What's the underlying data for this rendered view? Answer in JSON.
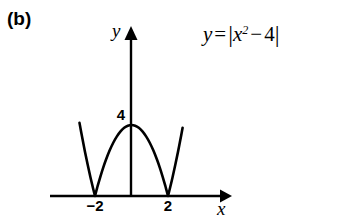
{
  "figure": {
    "panel_label": "(b)",
    "equation": {
      "lhs": "y",
      "relation": "=",
      "open_bar": "|",
      "base": "x",
      "exponent": "2",
      "minus": "−",
      "constant": "4",
      "close_bar": "|",
      "plain": "y = |x² − 4|"
    },
    "axes": {
      "x_label": "x",
      "y_label": "y",
      "stroke_color": "#000000",
      "background_color": "#ffffff"
    },
    "tick_labels": {
      "x_left": "−2",
      "x_right": "2",
      "y_peak": "4"
    }
  },
  "chart_data": {
    "type": "line",
    "title": "",
    "subtitle": "",
    "xlabel": "x",
    "ylabel": "y",
    "function": "y = |x^2 - 4|",
    "xlim": [
      -3.55,
      3.0
    ],
    "ylim": [
      0,
      9.2
    ],
    "grid": false,
    "legend": null,
    "annotations": [
      {
        "text": "y = |x² − 4|",
        "x": 2.0,
        "y": 8.6
      },
      {
        "text": "(b)",
        "x": -3.5,
        "y": 9.0
      }
    ],
    "x_ticks": [
      -2,
      2
    ],
    "x_tick_labels": [
      "−2",
      "2"
    ],
    "y_ticks": [
      4
    ],
    "y_tick_labels": [
      "4"
    ],
    "key_points": [
      {
        "label": "left cusp (root)",
        "x": -2,
        "y": 0
      },
      {
        "label": "right cusp (root)",
        "x": 2,
        "y": 0
      },
      {
        "label": "arch vertex",
        "x": 0,
        "y": 4
      }
    ],
    "series": [
      {
        "name": "y = |x^2 - 4|",
        "color": "#000000",
        "line_width": 2.6,
        "x": [
          -2.85,
          -2.7,
          -2.55,
          -2.4,
          -2.25,
          -2.1,
          -2.0,
          -1.85,
          -1.7,
          -1.55,
          -1.4,
          -1.2,
          -1.0,
          -0.8,
          -0.6,
          -0.4,
          -0.2,
          0.0,
          0.2,
          0.4,
          0.6,
          0.8,
          1.0,
          1.2,
          1.4,
          1.55,
          1.7,
          1.85,
          2.0,
          2.1,
          2.25,
          2.4,
          2.55,
          2.7,
          2.8
        ],
        "y": [
          4.12,
          3.29,
          2.5,
          1.76,
          1.06,
          0.41,
          0.0,
          0.58,
          1.11,
          1.6,
          2.04,
          2.56,
          3.0,
          3.36,
          3.64,
          3.84,
          3.96,
          4.0,
          3.96,
          3.84,
          3.64,
          3.36,
          3.0,
          2.56,
          2.04,
          1.6,
          1.11,
          0.58,
          0.0,
          0.41,
          1.06,
          1.76,
          2.5,
          3.29,
          3.84
        ]
      }
    ]
  }
}
